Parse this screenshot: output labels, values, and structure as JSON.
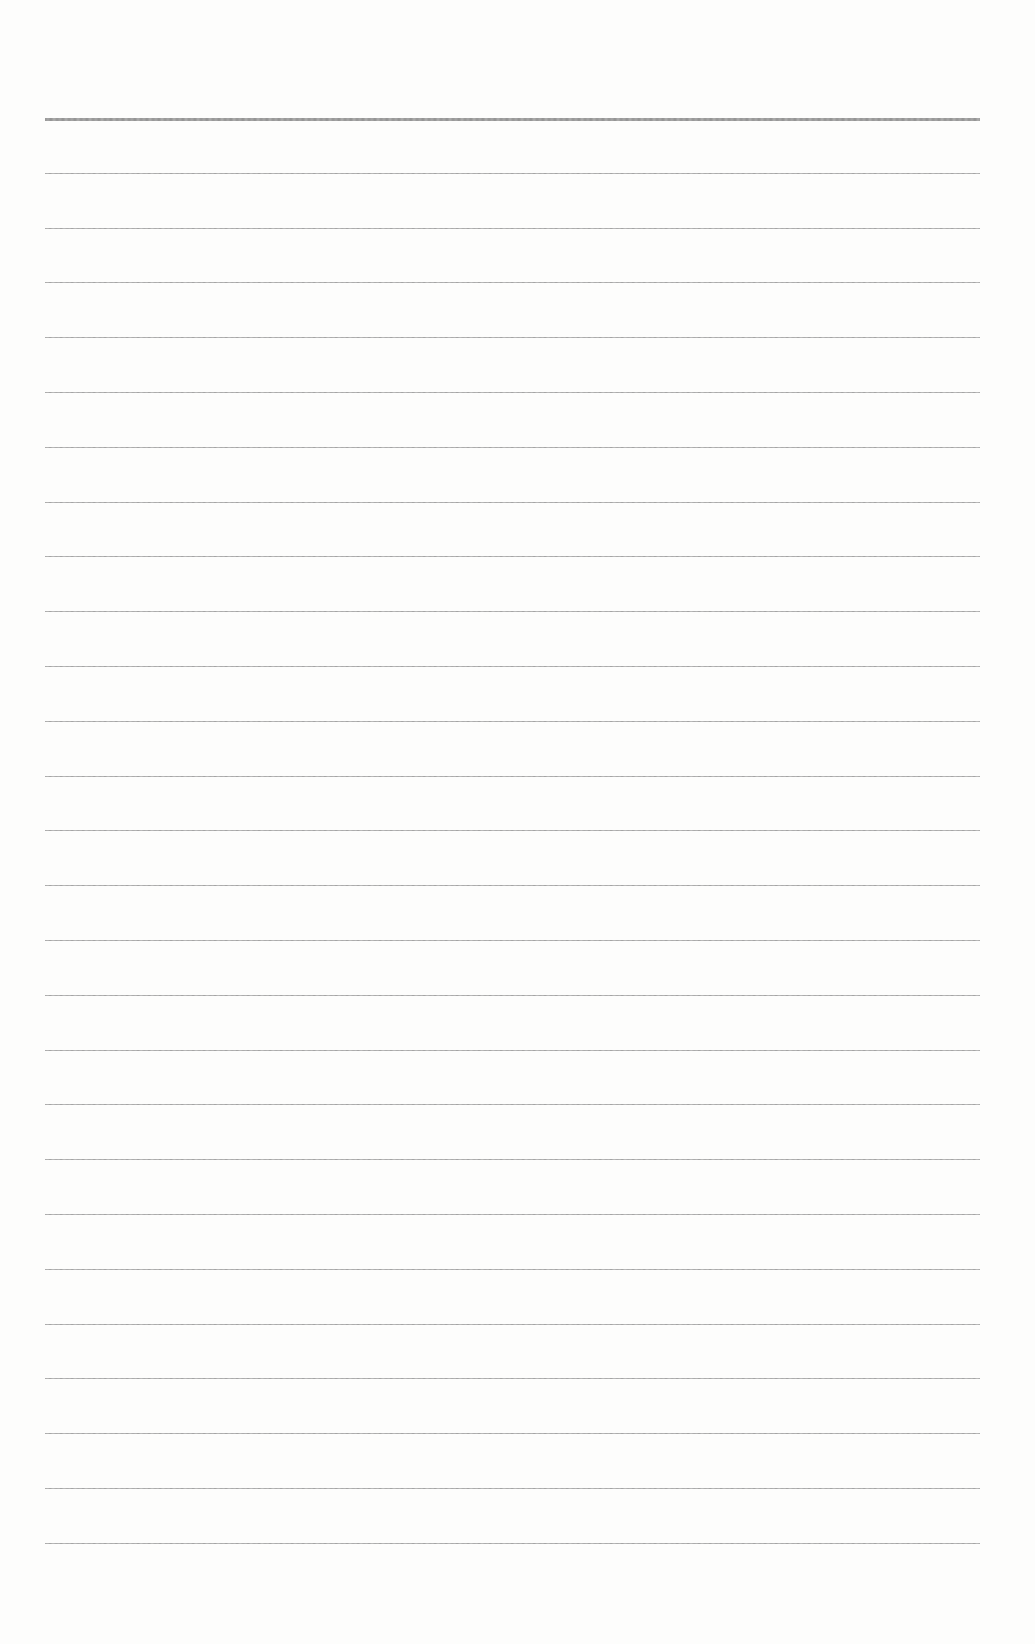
{
  "document": {
    "type": "ruled-paper",
    "background_color": "#fdfdfc",
    "rule_color": "#9a9a9a",
    "header_rule_color": "#8a8a8a",
    "rules": {
      "count": 27,
      "first_y": 118,
      "spacing": 54.8,
      "left_x": 45,
      "right_x": 980,
      "header_rule_index": 0
    },
    "text_content": []
  }
}
